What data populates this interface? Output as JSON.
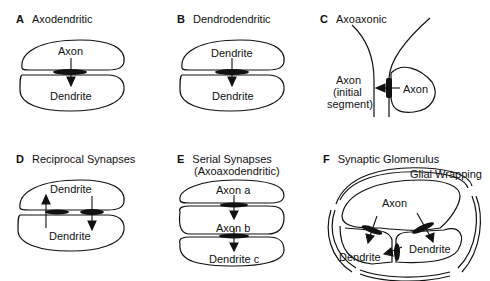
{
  "panels": [
    {
      "letter": "A",
      "title": "Axodendritic",
      "labels": [
        "Axon",
        "Dendrite"
      ]
    },
    {
      "letter": "B",
      "title": "Dendrodendritic",
      "labels": [
        "Dendrite",
        "Dendrite"
      ]
    },
    {
      "letter": "C",
      "title": "Axoaxonic",
      "labels": [
        "Axon",
        "(initial",
        "segment)",
        "Axon"
      ]
    },
    {
      "letter": "D",
      "title": "Reciprocal Synapses",
      "labels": [
        "Dendrite",
        "Dendrite"
      ]
    },
    {
      "letter": "E",
      "title": "Serial Synapses",
      "subtitle": "(Axoaxodendritic)",
      "labels": [
        "Axon a",
        "Axon b",
        "Dendrite c"
      ]
    },
    {
      "letter": "F",
      "title": "Synaptic Glomerulus",
      "labels": [
        "Glial Wrapping",
        "Axon",
        "Dendrite",
        "Dendrite"
      ]
    }
  ]
}
